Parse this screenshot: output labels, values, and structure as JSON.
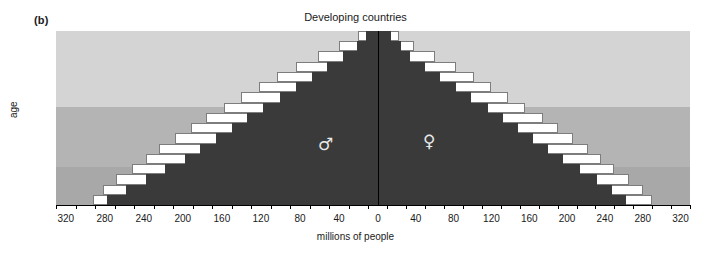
{
  "panel": {
    "label": "(b)"
  },
  "chart_data": {
    "type": "bar",
    "subtype": "population-pyramid",
    "title": "Developing countries",
    "xlabel": "millions of people",
    "ylabel": "age",
    "xlim": [
      -330,
      330
    ],
    "ylim": [
      0,
      85
    ],
    "grid": false,
    "legend_position": "none",
    "axis_note": "x-axis values are absolute magnitudes mirrored about 0",
    "x_tick_labels_left": [
      "320",
      "280",
      "240",
      "200",
      "160",
      "120",
      "80",
      "40",
      "0"
    ],
    "x_tick_labels_right": [
      "0",
      "40",
      "80",
      "120",
      "160",
      "200",
      "240",
      "280",
      "320"
    ],
    "x_tick_values": [
      -320,
      -280,
      -240,
      -200,
      -160,
      -120,
      -80,
      -40,
      0,
      40,
      80,
      120,
      160,
      200,
      240,
      280,
      320
    ],
    "x_minor_step": 20,
    "y_tick_labels": [
      "0",
      "10",
      "20",
      "30",
      "40",
      "50",
      "60",
      "70",
      "80"
    ],
    "y_tick_values": [
      0,
      10,
      20,
      30,
      40,
      50,
      60,
      70,
      80
    ],
    "age_groups": [
      "0-4",
      "5-9",
      "10-14",
      "15-19",
      "20-24",
      "25-29",
      "30-34",
      "35-39",
      "40-44",
      "45-49",
      "50-54",
      "55-59",
      "60-64",
      "65-69",
      "70-74",
      "75-79",
      "80-84"
    ],
    "series": [
      {
        "name": "Male projected total",
        "side": "left",
        "color": "#ffffff",
        "outline": "#7d7d7d",
        "values": [
          292,
          282,
          268,
          252,
          238,
          224,
          208,
          192,
          176,
          158,
          140,
          122,
          104,
          84,
          62,
          40,
          20
        ]
      },
      {
        "name": "Male current",
        "side": "left",
        "color": "#3a3a3a",
        "values": [
          278,
          258,
          238,
          218,
          198,
          182,
          166,
          150,
          134,
          118,
          100,
          84,
          68,
          52,
          36,
          22,
          12
        ]
      },
      {
        "name": "Female projected total",
        "side": "right",
        "color": "#ffffff",
        "outline": "#7d7d7d",
        "values": [
          290,
          280,
          266,
          250,
          236,
          222,
          206,
          190,
          174,
          156,
          138,
          120,
          102,
          82,
          60,
          38,
          22
        ]
      },
      {
        "name": "Female current",
        "side": "right",
        "color": "#3a3a3a",
        "values": [
          262,
          248,
          232,
          214,
          196,
          180,
          164,
          148,
          132,
          116,
          98,
          82,
          66,
          50,
          34,
          24,
          14
        ]
      }
    ],
    "background_bands": [
      {
        "name": "older-ages-band",
        "age_from": 45,
        "age_to": 85,
        "color": "#d4d4d4"
      },
      {
        "name": "working-ages-band",
        "age_from": 15,
        "age_to": 45,
        "color": "#b4b4b4"
      },
      {
        "name": "youth-ages-band",
        "age_from": 0,
        "age_to": 15,
        "color": "#a8a8a8"
      }
    ],
    "annotations": [
      {
        "name": "male-symbol",
        "glyph": "♂",
        "side": "left"
      },
      {
        "name": "female-symbol",
        "glyph": "♀",
        "side": "right"
      }
    ]
  }
}
